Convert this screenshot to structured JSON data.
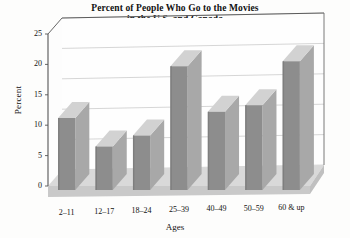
{
  "chart_data": {
    "type": "bar",
    "title": "Percent of People Who Go to the Movies in the U.S. and Canada",
    "title_lines": [
      "Percent of People Who Go to the Movies",
      "in the U.S. and Canada"
    ],
    "xlabel": "Ages",
    "ylabel": "Percent",
    "categories": [
      "2–11",
      "12–17",
      "18–24",
      "25–39",
      "40–49",
      "50–59",
      "60 & up"
    ],
    "values": [
      11.2,
      6.5,
      8.3,
      19.7,
      12.2,
      13.3,
      20.5
    ],
    "ylim": [
      0,
      25
    ],
    "yticks": [
      0,
      5,
      10,
      15,
      20,
      25
    ],
    "ytick_labels": [
      "0",
      "5",
      "10",
      "15",
      "20",
      "25"
    ],
    "grid": true,
    "legend": null,
    "style": "3d-bar",
    "colors": {
      "bar_front": "#8d8d8d",
      "bar_top": "#d2d2d2",
      "bar_side": "#a8a8a8",
      "floor": "#d9d9d9",
      "floor_front": "#c9c9c9",
      "grid": "#c4c4c4",
      "axis": "#555555",
      "background": "#fdfdfc",
      "text": "#111111"
    }
  }
}
